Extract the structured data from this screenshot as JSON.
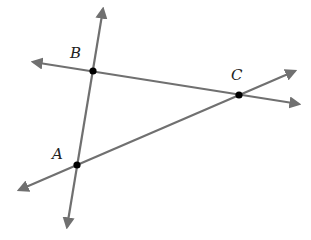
{
  "diagram": {
    "type": "geometry-lines",
    "colors": {
      "line": "#707070",
      "point": "#000000",
      "label": "#222222",
      "background": "#ffffff"
    },
    "points": [
      {
        "name": "B",
        "label": "B",
        "x": 93,
        "y": 71,
        "label_x": 70,
        "label_y": 58
      },
      {
        "name": "C",
        "label": "C",
        "x": 239,
        "y": 95,
        "label_x": 231,
        "label_y": 80
      },
      {
        "name": "A",
        "label": "A",
        "x": 77,
        "y": 165,
        "label_x": 52,
        "label_y": 159
      }
    ],
    "lines": [
      {
        "name": "line-BC",
        "through": [
          "B",
          "C"
        ],
        "x1": 33,
        "y1": 62,
        "x2": 299,
        "y2": 104
      },
      {
        "name": "line-AB",
        "through": [
          "A",
          "B"
        ],
        "x1": 67,
        "y1": 227,
        "x2": 103,
        "y2": 9
      },
      {
        "name": "line-AC",
        "through": [
          "A",
          "C"
        ],
        "x1": 19,
        "y1": 190,
        "x2": 295,
        "y2": 71
      }
    ]
  }
}
